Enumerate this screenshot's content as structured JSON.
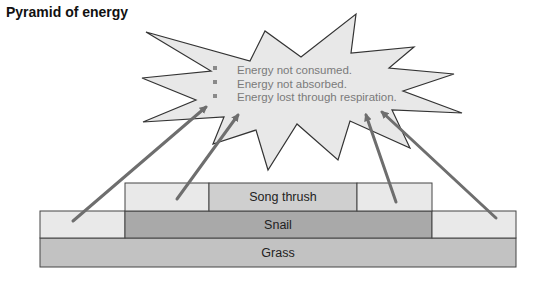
{
  "title": "Pyramid of energy",
  "callout": {
    "shape": "explosion-star",
    "fill": "#e8e8e8",
    "stroke": "#333333",
    "text_color": "#7a7a7a",
    "items": [
      "Energy not consumed.",
      "Energy not absorbed.",
      "Energy lost through respiration."
    ]
  },
  "pyramid": {
    "levels": [
      {
        "label": "Song thrush",
        "fill": "#cfcfcf",
        "loss_fill": "#e9e9e9"
      },
      {
        "label": "Snail",
        "fill": "#a9a9a9",
        "loss_fill": "#e9e9e9"
      },
      {
        "label": "Grass",
        "fill": "#c2c2c2"
      }
    ],
    "border_color": "#444444"
  },
  "arrows": {
    "color": "#6e6e6e",
    "count": 4,
    "description": "Arrows from the energy-loss segments of each level pointing to the callout"
  }
}
